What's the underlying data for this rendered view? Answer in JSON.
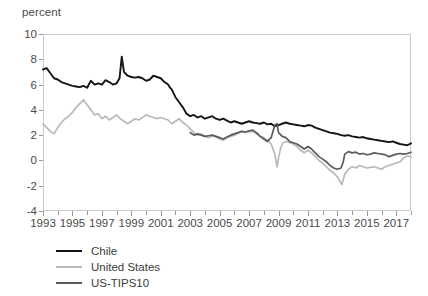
{
  "chart_data": {
    "type": "line",
    "title": "",
    "subtitle": "",
    "xlabel": "",
    "ylabel": "percent",
    "ylim": [
      -4,
      10
    ],
    "xlim": [
      1993,
      2018
    ],
    "grid": false,
    "legend_position": "below-left",
    "ytick_labels": [
      "10",
      "8",
      "6",
      "4",
      "2",
      "0",
      "-2",
      "-4"
    ],
    "ytick_values": [
      10,
      8,
      6,
      4,
      2,
      0,
      -2,
      -4
    ],
    "xtick_labels": [
      "1993",
      "1995",
      "1997",
      "1999",
      "2001",
      "2003",
      "2005",
      "2007",
      "2009",
      "2011",
      "2013",
      "2015",
      "2017"
    ],
    "xtick_values": [
      1993,
      1995,
      1997,
      1999,
      2001,
      2003,
      2005,
      2007,
      2009,
      2011,
      2013,
      2015,
      2017
    ],
    "xtick_minor_values": [
      1994,
      1996,
      1998,
      2000,
      2002,
      2004,
      2006,
      2008,
      2010,
      2012,
      2014,
      2016,
      2018
    ],
    "series": [
      {
        "name": "Chile",
        "color": "#141414",
        "width": 1.9,
        "x": [
          1993.0,
          1993.25,
          1993.5,
          1993.75,
          1994.0,
          1994.25,
          1994.5,
          1994.75,
          1995.0,
          1995.25,
          1995.5,
          1995.75,
          1996.0,
          1996.25,
          1996.5,
          1996.75,
          1997.0,
          1997.25,
          1997.5,
          1997.75,
          1998.0,
          1998.2,
          1998.35,
          1998.5,
          1998.75,
          1999.0,
          1999.25,
          1999.5,
          1999.75,
          2000.0,
          2000.25,
          2000.5,
          2000.75,
          2001.0,
          2001.25,
          2001.5,
          2001.6,
          2001.75,
          2002.0,
          2002.25,
          2002.5,
          2002.75,
          2003.0,
          2003.25,
          2003.5,
          2003.75,
          2004.0,
          2004.25,
          2004.5,
          2004.75,
          2005.0,
          2005.25,
          2005.5,
          2005.75,
          2006.0,
          2006.25,
          2006.5,
          2006.75,
          2007.0,
          2007.25,
          2007.5,
          2007.75,
          2008.0,
          2008.25,
          2008.5,
          2008.75,
          2009.0,
          2009.25,
          2009.5,
          2009.75,
          2010.0,
          2010.25,
          2010.5,
          2010.75,
          2011.0,
          2011.25,
          2011.5,
          2011.75,
          2012.0,
          2012.25,
          2012.5,
          2012.75,
          2013.0,
          2013.25,
          2013.5,
          2013.75,
          2014.0,
          2014.25,
          2014.5,
          2014.75,
          2015.0,
          2015.25,
          2015.5,
          2015.75,
          2016.0,
          2016.25,
          2016.5,
          2016.75,
          2017.0,
          2017.25,
          2017.5,
          2017.75,
          2018.0
        ],
        "values": [
          7.2,
          7.3,
          6.9,
          6.5,
          6.4,
          6.2,
          6.1,
          6.0,
          5.9,
          5.85,
          5.8,
          5.9,
          5.75,
          6.3,
          6.0,
          6.1,
          6.0,
          6.35,
          6.2,
          6.0,
          6.1,
          6.5,
          8.2,
          7.0,
          6.7,
          6.6,
          6.55,
          6.6,
          6.5,
          6.3,
          6.4,
          6.7,
          6.6,
          6.5,
          6.2,
          6.0,
          5.8,
          5.6,
          5.0,
          4.6,
          4.2,
          3.7,
          3.5,
          3.6,
          3.4,
          3.5,
          3.3,
          3.4,
          3.5,
          3.3,
          3.2,
          3.3,
          3.15,
          3.0,
          3.1,
          3.0,
          2.9,
          3.0,
          3.1,
          3.0,
          2.95,
          2.9,
          3.0,
          2.85,
          2.9,
          2.7,
          2.8,
          2.9,
          3.0,
          2.9,
          2.85,
          2.8,
          2.75,
          2.7,
          2.8,
          2.75,
          2.6,
          2.5,
          2.4,
          2.3,
          2.2,
          2.15,
          2.1,
          2.0,
          1.95,
          2.0,
          1.9,
          1.85,
          1.8,
          1.85,
          1.75,
          1.7,
          1.65,
          1.6,
          1.55,
          1.5,
          1.45,
          1.5,
          1.4,
          1.3,
          1.25,
          1.2,
          1.35
        ]
      },
      {
        "name": "United States",
        "color": "#b9b9b9",
        "width": 1.7,
        "x": [
          1993.0,
          1993.25,
          1993.5,
          1993.75,
          1994.0,
          1994.25,
          1994.5,
          1994.75,
          1995.0,
          1995.25,
          1995.5,
          1995.75,
          1996.0,
          1996.25,
          1996.5,
          1996.75,
          1997.0,
          1997.25,
          1997.5,
          1997.75,
          1998.0,
          1998.25,
          1998.5,
          1998.75,
          1999.0,
          1999.25,
          1999.5,
          1999.75,
          2000.0,
          2000.25,
          2000.5,
          2000.75,
          2001.0,
          2001.25,
          2001.5,
          2001.75,
          2002.0,
          2002.25,
          2002.5,
          2002.75,
          2003.0,
          2003.25,
          2003.5,
          2003.75,
          2004.0,
          2004.25,
          2004.5,
          2004.75,
          2005.0,
          2005.25,
          2005.5,
          2005.75,
          2006.0,
          2006.25,
          2006.5,
          2006.75,
          2007.0,
          2007.25,
          2007.5,
          2007.75,
          2008.0,
          2008.25,
          2008.5,
          2008.75,
          2008.9,
          2009.0,
          2009.15,
          2009.3,
          2009.5,
          2009.75,
          2010.0,
          2010.25,
          2010.5,
          2010.75,
          2011.0,
          2011.25,
          2011.5,
          2011.75,
          2012.0,
          2012.25,
          2012.5,
          2012.75,
          2013.0,
          2013.15,
          2013.3,
          2013.5,
          2013.75,
          2014.0,
          2014.25,
          2014.5,
          2014.75,
          2015.0,
          2015.25,
          2015.5,
          2015.75,
          2016.0,
          2016.25,
          2016.5,
          2016.75,
          2017.0,
          2017.25,
          2017.5,
          2017.75,
          2018.0
        ],
        "values": [
          2.9,
          2.6,
          2.3,
          2.1,
          2.6,
          3.0,
          3.3,
          3.5,
          3.8,
          4.2,
          4.5,
          4.8,
          4.4,
          4.0,
          3.6,
          3.7,
          3.3,
          3.5,
          3.2,
          3.4,
          3.6,
          3.3,
          3.1,
          2.9,
          3.1,
          3.3,
          3.2,
          3.4,
          3.6,
          3.5,
          3.4,
          3.3,
          3.4,
          3.3,
          3.2,
          2.9,
          3.1,
          3.3,
          3.0,
          2.8,
          2.5,
          2.2,
          2.0,
          2.1,
          1.9,
          1.8,
          1.95,
          1.85,
          1.7,
          1.6,
          1.8,
          1.9,
          2.0,
          2.15,
          2.3,
          2.2,
          2.25,
          2.3,
          2.1,
          1.9,
          1.8,
          1.6,
          1.3,
          0.5,
          -0.5,
          0.2,
          1.0,
          1.4,
          1.5,
          1.4,
          1.3,
          1.1,
          0.8,
          0.6,
          0.8,
          0.6,
          0.3,
          0.0,
          -0.2,
          -0.5,
          -0.8,
          -1.0,
          -1.3,
          -1.6,
          -1.9,
          -1.1,
          -0.7,
          -0.5,
          -0.6,
          -0.4,
          -0.5,
          -0.6,
          -0.55,
          -0.5,
          -0.6,
          -0.7,
          -0.5,
          -0.4,
          -0.3,
          -0.2,
          -0.1,
          0.2,
          0.35,
          0.3
        ]
      },
      {
        "name": "US-TIPS10",
        "color": "#5b5b5b",
        "width": 1.7,
        "x": [
          2003.0,
          2003.25,
          2003.5,
          2003.75,
          2004.0,
          2004.25,
          2004.5,
          2004.75,
          2005.0,
          2005.25,
          2005.5,
          2005.75,
          2006.0,
          2006.25,
          2006.5,
          2006.75,
          2007.0,
          2007.25,
          2007.5,
          2007.75,
          2008.0,
          2008.25,
          2008.5,
          2008.75,
          2008.9,
          2009.0,
          2009.25,
          2009.5,
          2009.75,
          2010.0,
          2010.25,
          2010.5,
          2010.75,
          2011.0,
          2011.25,
          2011.5,
          2011.75,
          2012.0,
          2012.25,
          2012.5,
          2012.75,
          2013.0,
          2013.25,
          2013.4,
          2013.5,
          2013.75,
          2014.0,
          2014.25,
          2014.5,
          2014.75,
          2015.0,
          2015.25,
          2015.5,
          2015.75,
          2016.0,
          2016.25,
          2016.5,
          2016.75,
          2017.0,
          2017.25,
          2017.5,
          2017.75,
          2018.0
        ],
        "values": [
          2.2,
          2.0,
          2.1,
          2.0,
          1.9,
          1.95,
          2.0,
          1.9,
          1.8,
          1.7,
          1.85,
          2.0,
          2.1,
          2.2,
          2.3,
          2.25,
          2.35,
          2.4,
          2.2,
          1.9,
          1.7,
          1.5,
          1.8,
          2.8,
          2.9,
          2.2,
          1.9,
          1.8,
          1.5,
          1.4,
          1.3,
          1.1,
          0.9,
          1.1,
          0.9,
          0.6,
          0.3,
          0.1,
          -0.1,
          -0.4,
          -0.6,
          -0.7,
          -0.6,
          -0.1,
          0.5,
          0.7,
          0.6,
          0.65,
          0.5,
          0.55,
          0.45,
          0.5,
          0.6,
          0.55,
          0.5,
          0.45,
          0.3,
          0.4,
          0.5,
          0.55,
          0.5,
          0.55,
          0.65
        ]
      }
    ],
    "legend": [
      {
        "label": "Chile",
        "color": "#141414"
      },
      {
        "label": "United States",
        "color": "#b9b9b9"
      },
      {
        "label": "US-TIPS10",
        "color": "#5b5b5b"
      }
    ]
  }
}
